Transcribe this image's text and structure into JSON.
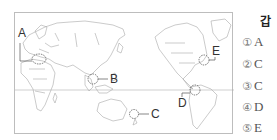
{
  "figure": {
    "type": "world map (Pacific-centered)",
    "regions": [
      {
        "id": "A",
        "label": "A",
        "location": "Central Europe"
      },
      {
        "id": "B",
        "label": "B",
        "location": "Southeast Asia (Indochina/Malaysia)"
      },
      {
        "id": "C",
        "label": "C",
        "location": "South Pacific (east of Australia)"
      },
      {
        "id": "D",
        "label": "D",
        "location": "Northern South America (Colombia/Venezuela)"
      },
      {
        "id": "E",
        "label": "E",
        "location": "Eastern North America (US East Coast)"
      }
    ],
    "equator_line": true
  },
  "side_panel": {
    "header": "갑",
    "choices": [
      {
        "num": "①",
        "value": "A"
      },
      {
        "num": "②",
        "value": "C"
      },
      {
        "num": "③",
        "value": "C"
      },
      {
        "num": "④",
        "value": "D"
      },
      {
        "num": "⑤",
        "value": "E"
      }
    ]
  },
  "colors": {
    "outline": "#9e9e9e",
    "frame": "#bdbdbd",
    "label_text": "#333333"
  }
}
